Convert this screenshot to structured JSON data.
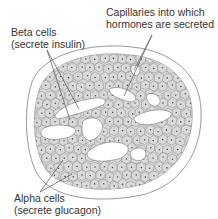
{
  "figure": {
    "labels": {
      "capillaries": {
        "line1": "Capillaries into which",
        "line2": "hormones are secreted"
      },
      "beta_cells": {
        "line1": "Beta cells",
        "line2": "(secrete insulin)"
      },
      "alpha_cells": {
        "line1": "Alpha cells",
        "line2": "(secrete glucagon)"
      }
    },
    "colors": {
      "cell_fill": "#d9d9d9",
      "cell_outline": "#8a8a8a",
      "nucleus": "#555555",
      "capsule": "#9a9a9a",
      "capillary": "#ffffff",
      "text": "#333333"
    }
  }
}
